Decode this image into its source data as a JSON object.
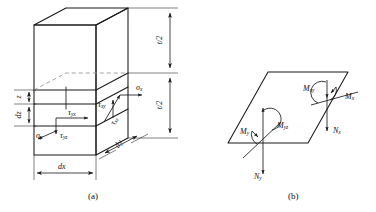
{
  "figure": {
    "panels": [
      {
        "id": "a",
        "caption": "(a)",
        "description": "Three-dimensional differential element of a plate showing in-plane normal and shear stresses acting on a thin slice at distance z from the mid-plane",
        "dimension_labels": [
          {
            "name": "thickness-upper-half",
            "text": "t/2"
          },
          {
            "name": "thickness-lower-half",
            "text": "t/2"
          },
          {
            "name": "coordinate-z",
            "text": "z"
          },
          {
            "name": "slice-thickness-dz",
            "text": "dz"
          },
          {
            "name": "element-width-dx",
            "text": "dx"
          },
          {
            "name": "element-depth-dy",
            "text": "dy"
          }
        ],
        "stress_labels": [
          {
            "name": "sigma-x",
            "sym": "σ",
            "sub": "x"
          },
          {
            "name": "sigma-y",
            "sym": "σ",
            "sub": "y"
          },
          {
            "name": "tau-yx",
            "sym": "τ",
            "sub": "yx"
          },
          {
            "name": "tau-yz",
            "sym": "τ",
            "sub": "yz"
          },
          {
            "name": "tau-xy",
            "sym": "τ",
            "sub": "xy"
          },
          {
            "name": "tau-xz",
            "sym": "τ",
            "sub": "xz"
          }
        ]
      },
      {
        "id": "b",
        "caption": "(b)",
        "description": "Plate mid-surface element shown as a parallelogram with bending moments, twisting moments and transverse shear resultants",
        "resultant_labels": [
          {
            "name": "moment-x",
            "sym": "M",
            "sub": "x"
          },
          {
            "name": "moment-xy",
            "sym": "M",
            "sub": "xy"
          },
          {
            "name": "shear-nx",
            "sym": "N",
            "sub": "x"
          },
          {
            "name": "moment-y",
            "sym": "M",
            "sub": "y"
          },
          {
            "name": "moment-yz",
            "sym": "M",
            "sub": "yz"
          },
          {
            "name": "shear-ny",
            "sym": "N",
            "sub": "y"
          }
        ]
      }
    ],
    "colors": {
      "stroke": "#1a1a1a",
      "hidden_stroke": "#8c8c8c",
      "background": "#ffffff"
    }
  }
}
